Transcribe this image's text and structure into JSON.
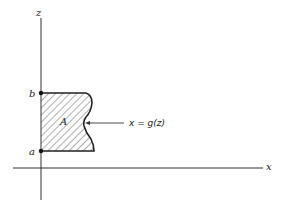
{
  "diagram": {
    "axes": {
      "vertical_label": "z",
      "horizontal_label": "x"
    },
    "points": [
      {
        "label": "b",
        "position": "upper bound on z-axis"
      },
      {
        "label": "a",
        "position": "lower bound on z-axis"
      }
    ],
    "region": {
      "label": "A",
      "fill": "hatched",
      "boundary_left": "z-axis",
      "boundary_right_label": "x = g(z)"
    },
    "colors": {
      "stroke": "#222222",
      "background": "#ffffff"
    }
  }
}
